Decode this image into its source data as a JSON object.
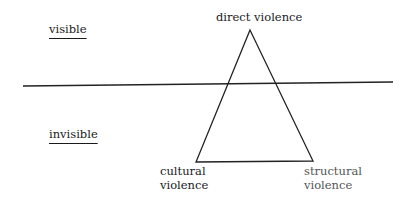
{
  "diagram": {
    "zones": {
      "visible": "visible",
      "invisible": "invisible"
    },
    "vertices": {
      "top": "direct violence",
      "bottom_left_line1": "cultural",
      "bottom_left_line2": "violence",
      "bottom_right_line1": "structural",
      "bottom_right_line2": "violence"
    }
  }
}
